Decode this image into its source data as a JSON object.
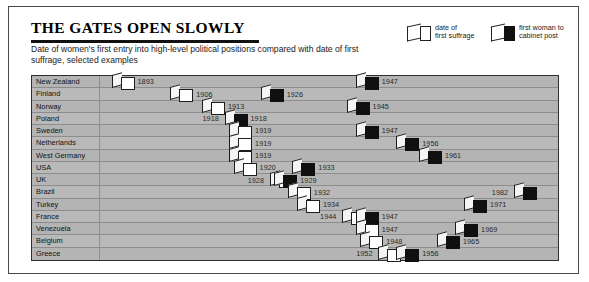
{
  "title": "THE GATES OPEN SLOWLY",
  "subtitle": "Date of women's first entry into high-level political positions compared with date of first suffrage, selected examples",
  "legend": [
    {
      "name": "suffrage-legend",
      "label": "date of\nfirst suffrage",
      "swatch": "white"
    },
    {
      "name": "cabinet-legend",
      "label": "first woman to\ncabinet post",
      "swatch": "black"
    }
  ],
  "colors": {
    "plot_bg": "#b4b4b4",
    "row_alt": "#b9b9b9",
    "grid": "#8d8d8d",
    "suffrage": "#ffffff",
    "cabinet": "#101010",
    "frame": "#4a4a4a"
  },
  "chart_data": {
    "type": "bar",
    "title": "THE GATES OPEN SLOWLY",
    "xlabel": "",
    "ylabel": "",
    "xlim": [
      1890,
      1990
    ],
    "grid": true,
    "legend_position": "top-right",
    "categories": [
      "New Zealand",
      "Finland",
      "Norway",
      "Poland",
      "Sweden",
      "Netherlands",
      "West Germany",
      "USA",
      "UK",
      "Brazil",
      "Turkey",
      "France",
      "Venezuela",
      "Belgium",
      "Greece"
    ],
    "series": [
      {
        "name": "date of first suffrage",
        "values": [
          1893,
          1906,
          1913,
          1918,
          1919,
          1919,
          1919,
          1920,
          1928,
          1932,
          1934,
          1944,
          1947,
          1948,
          1952
        ]
      },
      {
        "name": "first woman to cabinet post",
        "values": [
          1947,
          1926,
          1945,
          1918,
          1947,
          1956,
          1961,
          1933,
          1929,
          1982,
          1971,
          1947,
          1969,
          1965,
          1956
        ]
      }
    ],
    "rows": [
      {
        "country": "New Zealand",
        "suffrage": 1893,
        "cabinet": 1947,
        "suffrage_label": "1893",
        "cabinet_label": "1947"
      },
      {
        "country": "Finland",
        "suffrage": 1906,
        "cabinet": 1926,
        "suffrage_label": "1906",
        "cabinet_label": "1926"
      },
      {
        "country": "Norway",
        "suffrage": 1913,
        "cabinet": 1945,
        "suffrage_label": "1913",
        "cabinet_label": "1945"
      },
      {
        "country": "Poland",
        "suffrage": 1918,
        "cabinet": 1918,
        "suffrage_label": "1918",
        "cabinet_label": "1918"
      },
      {
        "country": "Sweden",
        "suffrage": 1919,
        "cabinet": 1947,
        "suffrage_label": "1919",
        "cabinet_label": "1947"
      },
      {
        "country": "Netherlands",
        "suffrage": 1919,
        "cabinet": 1956,
        "suffrage_label": "1919",
        "cabinet_label": "1956"
      },
      {
        "country": "West Germany",
        "suffrage": 1919,
        "cabinet": 1961,
        "suffrage_label": "1919",
        "cabinet_label": "1961"
      },
      {
        "country": "USA",
        "suffrage": 1920,
        "cabinet": 1933,
        "suffrage_label": "1920",
        "cabinet_label": "1933"
      },
      {
        "country": "UK",
        "suffrage": 1928,
        "cabinet": 1929,
        "suffrage_label": "1928",
        "cabinet_label": "1929"
      },
      {
        "country": "Brazil",
        "suffrage": 1932,
        "cabinet": 1982,
        "suffrage_label": "1932",
        "cabinet_label": "1982"
      },
      {
        "country": "Turkey",
        "suffrage": 1934,
        "cabinet": 1971,
        "suffrage_label": "1934",
        "cabinet_label": "1971"
      },
      {
        "country": "France",
        "suffrage": 1944,
        "cabinet": 1947,
        "suffrage_label": "1944",
        "cabinet_label": "1947"
      },
      {
        "country": "Venezuela",
        "suffrage": 1947,
        "cabinet": 1969,
        "suffrage_label": "1947",
        "cabinet_label": "1969"
      },
      {
        "country": "Belgium",
        "suffrage": 1948,
        "cabinet": 1965,
        "suffrage_label": "1948",
        "cabinet_label": "1965"
      },
      {
        "country": "Greece",
        "suffrage": 1952,
        "cabinet": 1956,
        "suffrage_label": "1952",
        "cabinet_label": "1956"
      }
    ]
  }
}
